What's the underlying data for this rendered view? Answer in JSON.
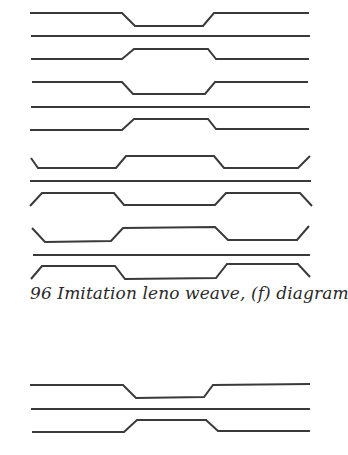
{
  "figure": {
    "caption": "96  Imitation leno weave, (f) diagram 87",
    "number": "96",
    "title": "Imitation leno weave, (f) diagram 87",
    "stroke_color": "#3a3a3a"
  },
  "diagram_top": {
    "threads": [
      "30,13 122,13 135,26 203,26 214,13 309,13",
      "31,36 310,36",
      "31,59 122,59 134,49 208,49 216,59 309,59",
      "32,82 122,82 133,94 205,94 215,82 308,82",
      "31,107 310,107",
      "30,130 122,130 134,119 208,119 216,129 309,129"
    ]
  },
  "diagram_middle": {
    "threads": [
      "31,158 38,168 116,168 126,156 214,156 224,168 298,168 310,156",
      "30,181 311,181",
      "30,206 42,193 114,193 124,205 215,205 226,193 300,193 312,206",
      "32,228 45,242 111,241 123,228 215,227 228,240 297,240 309,226",
      "33,255 310,255",
      "31,279 42,266 115,266 125,279 216,278 227,264 298,264 310,277"
    ]
  },
  "diagram_bottom": {
    "threads": [
      "30,385 123,385 136,398 204,397 213,385 310,384",
      "31,409 310,409",
      "32,432 124,432 137,420 206,420 218,431 310,431"
    ]
  }
}
